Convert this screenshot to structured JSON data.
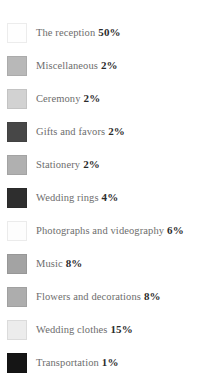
{
  "chart_data": {
    "type": "pie",
    "title": "",
    "subtitle": "",
    "xlabel": "",
    "ylabel": "",
    "legend_position": "left",
    "grid": false,
    "categories": [
      "The reception",
      "Miscellaneous",
      "Ceremony",
      "Gifts and favors",
      "Stationery",
      "Wedding rings",
      "Photographs and videography",
      "Music",
      "Flowers and decorations",
      "Wedding clothes",
      "Transportation"
    ],
    "values": [
      50,
      2,
      2,
      2,
      2,
      4,
      6,
      8,
      8,
      15,
      1
    ],
    "value_suffix": "%",
    "colors": [
      "#fefefe",
      "#b8b8b8",
      "#d2d2d2",
      "#474747",
      "#b0b0b0",
      "#2e2e2e",
      "#fdfdfd",
      "#a3a3a3",
      "#adadad",
      "#ececec",
      "#151515"
    ]
  },
  "legend": {
    "items": [
      {
        "label": "The reception",
        "value": "50%",
        "color": "#fefefe"
      },
      {
        "label": "Miscellaneous",
        "value": "2%",
        "color": "#b8b8b8"
      },
      {
        "label": "Ceremony",
        "value": "2%",
        "color": "#d2d2d2"
      },
      {
        "label": "Gifts and favors",
        "value": "2%",
        "color": "#474747"
      },
      {
        "label": "Stationery",
        "value": "2%",
        "color": "#b0b0b0"
      },
      {
        "label": "Wedding rings",
        "value": "4%",
        "color": "#2e2e2e"
      },
      {
        "label": "Photographs and videography",
        "value": "6%",
        "color": "#fdfdfd"
      },
      {
        "label": "Music",
        "value": "8%",
        "color": "#a3a3a3"
      },
      {
        "label": "Flowers and decorations",
        "value": "8%",
        "color": "#adadad"
      },
      {
        "label": "Wedding clothes",
        "value": "15%",
        "color": "#ececec"
      },
      {
        "label": "Transportation",
        "value": "1%",
        "color": "#151515"
      }
    ]
  }
}
